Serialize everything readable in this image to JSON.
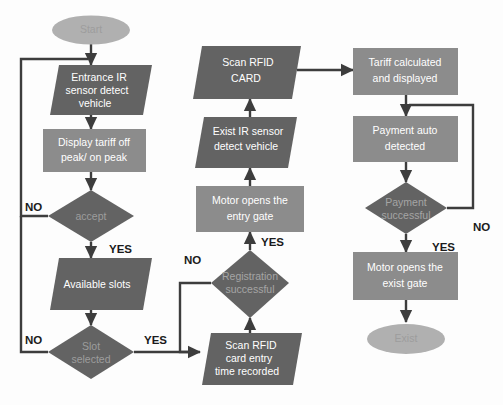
{
  "diagram": {
    "canvas": {
      "width": 503,
      "height": 405
    },
    "colors": {
      "background": "#fdfdfd",
      "shape_dark": "#636363",
      "shape_mid": "#8c8c8c",
      "shape_light": "#b0b0b0",
      "edge": "#3d3d3d",
      "node_text": "#ffffff",
      "edge_text": "#1b1b1b"
    },
    "nodes": [
      {
        "id": "start",
        "shape": "terminator",
        "tone": "light",
        "lines": [
          "Start"
        ]
      },
      {
        "id": "entrance_ir",
        "shape": "parallelogram",
        "tone": "dark",
        "lines": [
          "Entrance IR",
          "sensor detect",
          "vehicle"
        ]
      },
      {
        "id": "display_tariff",
        "shape": "rectangle",
        "tone": "mid",
        "lines": [
          "Display tariff off",
          "peak/ on peak"
        ]
      },
      {
        "id": "accept",
        "shape": "diamond",
        "tone": "dark",
        "lines": [
          "accept"
        ]
      },
      {
        "id": "available_slots",
        "shape": "parallelogram",
        "tone": "dark",
        "lines": [
          "Available slots"
        ]
      },
      {
        "id": "slot_selected",
        "shape": "diamond",
        "tone": "dark",
        "lines": [
          "Slot",
          "selected"
        ]
      },
      {
        "id": "scan_entry",
        "shape": "parallelogram",
        "tone": "dark",
        "lines": [
          "Scan RFID",
          "card entry",
          "time recorded"
        ]
      },
      {
        "id": "registration",
        "shape": "diamond",
        "tone": "dark",
        "lines": [
          "Registration",
          "successful"
        ]
      },
      {
        "id": "motor_entry",
        "shape": "rectangle",
        "tone": "mid",
        "lines": [
          "Motor opens the",
          "entry gate"
        ]
      },
      {
        "id": "exist_ir",
        "shape": "parallelogram",
        "tone": "dark",
        "lines": [
          "Exist IR sensor",
          "detect vehicle"
        ]
      },
      {
        "id": "scan_card",
        "shape": "parallelogram",
        "tone": "dark",
        "lines": [
          "Scan RFID",
          "CARD"
        ]
      },
      {
        "id": "tariff_calc",
        "shape": "rectangle",
        "tone": "mid",
        "lines": [
          "Tariff calculated",
          "and displayed"
        ]
      },
      {
        "id": "payment_auto",
        "shape": "rectangle",
        "tone": "mid",
        "lines": [
          "Payment auto",
          "detected"
        ]
      },
      {
        "id": "payment_ok",
        "shape": "diamond",
        "tone": "dark",
        "lines": [
          "Payment",
          "successful"
        ]
      },
      {
        "id": "motor_exist",
        "shape": "rectangle",
        "tone": "mid",
        "lines": [
          "Motor opens the",
          "exist gate"
        ]
      },
      {
        "id": "exist",
        "shape": "terminator",
        "tone": "light",
        "lines": [
          "Exist"
        ]
      }
    ],
    "edge_labels": [
      {
        "id": "accept_no",
        "text": "NO"
      },
      {
        "id": "accept_yes",
        "text": "YES"
      },
      {
        "id": "slot_no",
        "text": "NO"
      },
      {
        "id": "slot_yes",
        "text": "YES"
      },
      {
        "id": "registration_no",
        "text": "NO"
      },
      {
        "id": "registration_yes",
        "text": "YES"
      },
      {
        "id": "payment_no",
        "text": "NO"
      },
      {
        "id": "payment_yes",
        "text": "YES"
      }
    ],
    "edges": [
      {
        "from": "start",
        "to": "entrance_ir",
        "label": ""
      },
      {
        "from": "entrance_ir",
        "to": "display_tariff",
        "label": ""
      },
      {
        "from": "display_tariff",
        "to": "accept",
        "label": ""
      },
      {
        "from": "accept",
        "to": "entrance_ir",
        "label": "NO"
      },
      {
        "from": "accept",
        "to": "available_slots",
        "label": "YES"
      },
      {
        "from": "available_slots",
        "to": "slot_selected",
        "label": ""
      },
      {
        "from": "slot_selected",
        "to": "entrance_ir",
        "label": "NO"
      },
      {
        "from": "slot_selected",
        "to": "scan_entry",
        "label": "YES"
      },
      {
        "from": "scan_entry",
        "to": "registration",
        "label": ""
      },
      {
        "from": "registration",
        "to": "scan_entry",
        "label": "NO"
      },
      {
        "from": "registration",
        "to": "motor_entry",
        "label": "YES"
      },
      {
        "from": "motor_entry",
        "to": "exist_ir",
        "label": ""
      },
      {
        "from": "exist_ir",
        "to": "scan_card",
        "label": ""
      },
      {
        "from": "scan_card",
        "to": "tariff_calc",
        "label": ""
      },
      {
        "from": "tariff_calc",
        "to": "payment_auto",
        "label": ""
      },
      {
        "from": "payment_auto",
        "to": "payment_ok",
        "label": ""
      },
      {
        "from": "payment_ok",
        "to": "payment_auto",
        "label": "NO"
      },
      {
        "from": "payment_ok",
        "to": "motor_exist",
        "label": "YES"
      },
      {
        "from": "motor_exist",
        "to": "exist",
        "label": ""
      }
    ]
  }
}
